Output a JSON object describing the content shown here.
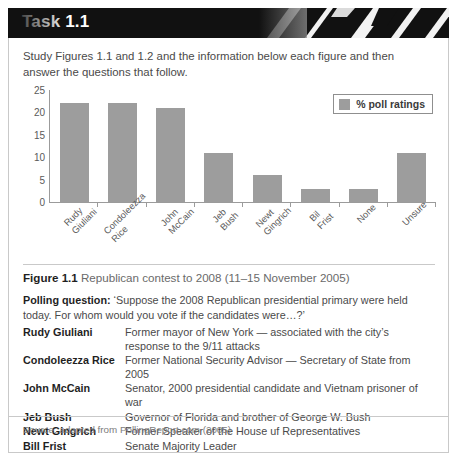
{
  "header": {
    "title": "Task 1.1"
  },
  "intro": "Study Figures 1.1 and 1.2 and the information below each figure and then answer the questions that follow.",
  "chart_data": {
    "type": "bar",
    "title": "",
    "categories": [
      "Rudy Giuliani",
      "Condoleezza Rice",
      "John McCain",
      "Jeb Bush",
      "Newt Gingrich",
      "Bil Frist",
      "None",
      "Unsure"
    ],
    "category_lines": [
      [
        "Rudy",
        "Giuliani"
      ],
      [
        "Condoleezza",
        "Rice"
      ],
      [
        "John",
        "McCain"
      ],
      [
        "Jeb",
        "Bush"
      ],
      [
        "Newt",
        "Gingrich"
      ],
      [
        "Bil",
        "Frist"
      ],
      [
        "None"
      ],
      [
        "Unsure"
      ]
    ],
    "values": [
      22,
      22,
      21,
      11,
      6,
      3,
      3,
      11
    ],
    "series": [
      {
        "name": "% poll ratings",
        "values": [
          22,
          22,
          21,
          11,
          6,
          3,
          3,
          11
        ]
      }
    ],
    "legend": [
      "% poll ratings"
    ],
    "legend_position": "top-right",
    "xlabel": "",
    "ylabel": "",
    "ylim": [
      0,
      25
    ],
    "yticks": [
      0,
      5,
      10,
      15,
      20,
      25
    ],
    "grid": false,
    "bar_color": "#9d9d9d",
    "axis_color": "#9b9b9b"
  },
  "figure": {
    "label": "Figure 1.1",
    "caption": "Republican contest to 2008 (11–15 November 2005)"
  },
  "polling": {
    "label": "Polling question:",
    "text": "‘Suppose the 2008 Republican presidential primary were held today. For whom would you vote if the candidates were…?’"
  },
  "candidates": [
    {
      "name": "Rudy Giuliani",
      "description": "Former mayor of New York — associated with the city’s response to the 9/11 attacks"
    },
    {
      "name": "Condoleezza Rice",
      "description": "Former National Security Advisor — Secretary of State from 2005"
    },
    {
      "name": "John McCain",
      "description": "Senator, 2000 presidential candidate and Vietnam prisoner of war"
    },
    {
      "name": "Jeb Bush",
      "description": "Governor of Florida and brother of George W. Bush"
    },
    {
      "name": "Newt Gingrich",
      "description": "Former Speaker of the House uf Representatives"
    },
    {
      "name": "Bill Frist",
      "description": "Senate Majority Leader"
    }
  ],
  "source": "Source: adapted from PollingReport.com (2005)"
}
